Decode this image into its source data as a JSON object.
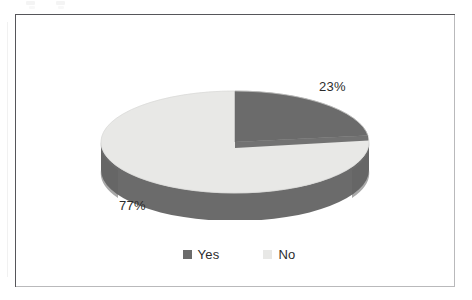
{
  "chart_data": {
    "type": "pie",
    "title": "",
    "subtitle": "",
    "xlabel": "",
    "ylabel": "",
    "three_d": true,
    "start_angle_deg": 0,
    "direction": "clockwise",
    "legend_position": "bottom",
    "grid": false,
    "categories": [
      "Yes",
      "No"
    ],
    "values": [
      23,
      77
    ],
    "value_unit": "%",
    "slices": [
      {
        "label": "Yes",
        "value": 23,
        "display": "23%",
        "color": "#6b6b6b",
        "side_color": "#6b6b6b"
      },
      {
        "label": "No",
        "value": 77,
        "display": "77%",
        "color": "#e8e8e6",
        "side_color": "#6b6b6b"
      }
    ],
    "data_labels": [
      {
        "name": "yes-percent",
        "text": "23%"
      },
      {
        "name": "no-percent",
        "text": "77%"
      }
    ],
    "legend": [
      {
        "label": "Yes",
        "swatch_color": "#6b6b6b",
        "swatch_name": "legend-swatch-yes"
      },
      {
        "label": "No",
        "swatch_color": "#e8e8e6",
        "swatch_name": "legend-swatch-no"
      }
    ]
  },
  "colors": {
    "background": "#ffffff",
    "frame_border": "#56565a",
    "slice_dark": "#6b6b6b",
    "slice_light": "#e8e8e6",
    "text": "#2c2c2c"
  },
  "labels": {
    "yes_percent": "23%",
    "no_percent": "77%"
  },
  "legend": {
    "yes_label": "Yes",
    "no_label": "No"
  }
}
